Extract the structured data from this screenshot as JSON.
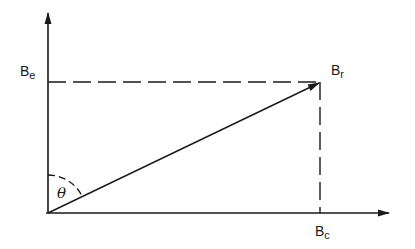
{
  "diagram": {
    "type": "vector-decomposition",
    "colors": {
      "stroke": "#1a1a1a",
      "background": "#ffffff"
    },
    "axes": {
      "vertical": {
        "x": 48,
        "y_from": 213,
        "y_to": 12,
        "arrowhead": true
      },
      "horizontal": {
        "y": 213,
        "x_from": 48,
        "x_to": 390,
        "arrowhead": true
      }
    },
    "resultant": {
      "from": [
        48,
        213
      ],
      "to": [
        320,
        82
      ],
      "arrowhead": true
    },
    "dashed_lines": [
      {
        "from": [
          48,
          82
        ],
        "to": [
          320,
          82
        ]
      },
      {
        "from": [
          320,
          82
        ],
        "to": [
          320,
          213
        ]
      }
    ],
    "angle_arc": {
      "center": [
        48,
        213
      ],
      "radius": 38,
      "between": "vertical-axis and resultant"
    },
    "labels": {
      "be": {
        "main": "B",
        "sub": "e"
      },
      "br": {
        "main": "B",
        "sub": "r"
      },
      "bc": {
        "main": "B",
        "sub": "c"
      },
      "theta": "θ"
    }
  }
}
